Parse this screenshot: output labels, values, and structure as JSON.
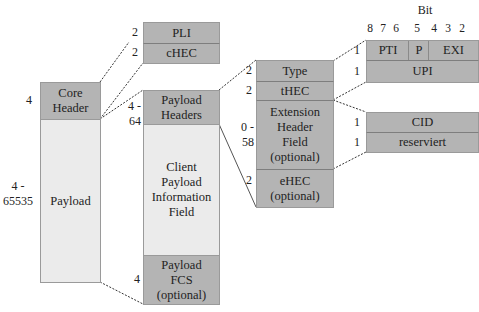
{
  "colors": {
    "dark_fill": "#b4b4b4",
    "light_fill": "#ebebeb",
    "line": "#333333"
  },
  "frame": {
    "core_header": {
      "label_line1": "Core",
      "label_line2": "Header",
      "size": "4"
    },
    "payload": {
      "label": "Payload",
      "size_line1": "4 -",
      "size_line2": "65535"
    }
  },
  "core_header_detail": {
    "pli": {
      "label": "PLI",
      "size": "2"
    },
    "chec": {
      "label": "cHEC",
      "size": "2"
    }
  },
  "payload_detail": {
    "payload_headers": {
      "label_line1": "Payload",
      "label_line2": "Headers",
      "size_line1": "4 -",
      "size_line2": "64"
    },
    "client_payload": {
      "label_lines": [
        "Client",
        "Payload",
        "Information",
        "Field"
      ]
    },
    "payload_fcs": {
      "label_lines": [
        "Payload",
        "FCS",
        "(optional)"
      ],
      "size": "4"
    }
  },
  "payload_headers_detail": {
    "type": {
      "label": "Type",
      "size": "2"
    },
    "thec": {
      "label": "tHEC",
      "size": "2"
    },
    "extension": {
      "label_lines": [
        "Extension",
        "Header",
        "Field",
        "(optional)"
      ],
      "size_line1": "0 -",
      "size_line2": "58"
    },
    "ehec": {
      "label_lines": [
        "eHEC",
        "(optional)"
      ],
      "size": "2"
    }
  },
  "type_detail": {
    "bit_title": "Bit",
    "bit_numbers": [
      "8",
      "7",
      "6",
      "5",
      "4",
      "3",
      "2"
    ],
    "pti": {
      "label": "PTI"
    },
    "p": {
      "label": "P"
    },
    "exi": {
      "label": "EXI"
    },
    "row1_size": "1",
    "upi": {
      "label": "UPI",
      "size": "1"
    }
  },
  "extension_detail": {
    "cid": {
      "label": "CID",
      "size": "1"
    },
    "reserviert": {
      "label": "reserviert",
      "size": "1"
    }
  }
}
